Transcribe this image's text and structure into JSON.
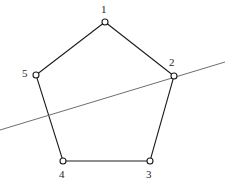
{
  "figure": {
    "type": "geometry-diagram",
    "background_color": "#ffffff",
    "width": 225,
    "height": 187,
    "polygon": {
      "name": "pentagon",
      "stroke_color": "#1c1c1c",
      "stroke_width": 1.1,
      "fill": "none",
      "closed": true,
      "vertices": [
        {
          "label": "1",
          "x": 105,
          "y": 22,
          "label_x": 101,
          "label_y": 4,
          "label_position": "above"
        },
        {
          "label": "2",
          "x": 174,
          "y": 76,
          "label_x": 169,
          "label_y": 57,
          "label_position": "above-left"
        },
        {
          "label": "3",
          "x": 150,
          "y": 161,
          "label_x": 146,
          "label_y": 169,
          "label_position": "below"
        },
        {
          "label": "4",
          "x": 63,
          "y": 161,
          "label_x": 59,
          "label_y": 169,
          "label_position": "below"
        },
        {
          "label": "5",
          "x": 36,
          "y": 75,
          "label_x": 22,
          "label_y": 68,
          "label_position": "left"
        }
      ]
    },
    "vertex_marker": {
      "shape": "circle",
      "radius": 3,
      "fill_color": "#ffffff",
      "stroke_color": "#1c1c1c",
      "stroke_width": 1.1
    },
    "secant_line": {
      "name": "secant-line",
      "stroke_color": "#6e6e6e",
      "stroke_width": 1,
      "x1": 0,
      "y1": 130,
      "x2": 225,
      "y2": 62
    }
  }
}
